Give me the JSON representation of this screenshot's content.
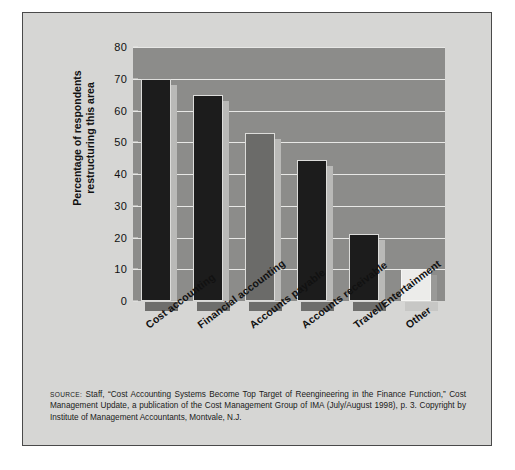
{
  "chart_data": {
    "type": "bar",
    "title": "",
    "xlabel": "",
    "ylabel": "Percentage of respondents restructuring this area",
    "ylabel_line1": "Percentage of respondents",
    "ylabel_line2": "restructuring this area",
    "categories": [
      "Cost accounting",
      "Financial accounting",
      "Accounts payable",
      "Accounts receivable",
      "Travel/Entertainment",
      "Other"
    ],
    "values": [
      70,
      65,
      53,
      44.5,
      21,
      10
    ],
    "ylim": [
      0,
      80
    ],
    "ytick_labels": [
      "0",
      "10",
      "20",
      "30",
      "40",
      "50",
      "60",
      "70",
      "80"
    ],
    "ytick_values": [
      0,
      10,
      20,
      30,
      40,
      50,
      60,
      70,
      80
    ],
    "grid": true,
    "legend": "none",
    "colors": {
      "plot_background": "#8c8c8a",
      "figure_background": "#d6d6d4",
      "gridline": "#e8e8e6",
      "bar_dark": "#1c1c1c",
      "bar_light": "#ececea",
      "bar_highlight": "#b9b9b7",
      "bar_foot": "#6e6e6c",
      "border": "#4a4a4a",
      "text": "#111111"
    },
    "bar_styles": [
      "dark",
      "dark",
      "mid",
      "dark",
      "dark",
      "light"
    ]
  },
  "source": {
    "label": "Source:",
    "text": "Staff, “Cost Accounting Systems Become Top Target of Reengineering in the Finance Function,” Cost Management Update, a publication of the Cost Management Group of IMA (July/August 1998), p. 3. Copyright by Institute of Management Accountants, Montvale, N.J."
  }
}
